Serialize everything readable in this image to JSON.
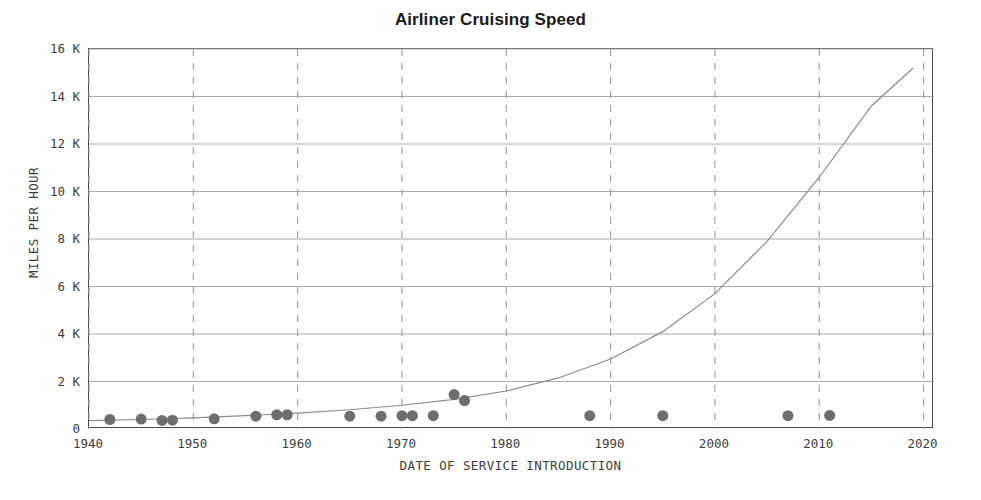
{
  "chart_data": {
    "type": "scatter",
    "title": "Airliner Cruising Speed",
    "xlabel": "DATE OF SERVICE INTRODUCTION",
    "ylabel": "MILES PER HOUR",
    "xlim": [
      1940,
      2021
    ],
    "ylim": [
      0,
      16000
    ],
    "xticks": [
      1940,
      1950,
      1960,
      1970,
      1980,
      1990,
      2000,
      2010,
      2020
    ],
    "xticklabels": [
      "1940",
      "1950",
      "1960",
      "1970",
      "1980",
      "1990",
      "2000",
      "2010",
      "2020"
    ],
    "yticks": [
      0,
      2000,
      4000,
      6000,
      8000,
      10000,
      12000,
      14000,
      16000
    ],
    "yticklabels": [
      "0",
      "2 K",
      "4 K",
      "6 K",
      "8 K",
      "10 K",
      "12 K",
      "14 K",
      "16 K"
    ],
    "grid": "horizontal solid gray, vertical dashed gray",
    "legend": "none",
    "marker_color": "#6e6e6e",
    "marker_size": 11,
    "curve_color": "#8c8c8c",
    "points": [
      {
        "x": 1942,
        "y": 400
      },
      {
        "x": 1945,
        "y": 420
      },
      {
        "x": 1947,
        "y": 360
      },
      {
        "x": 1948,
        "y": 370
      },
      {
        "x": 1952,
        "y": 430
      },
      {
        "x": 1956,
        "y": 540
      },
      {
        "x": 1958,
        "y": 600
      },
      {
        "x": 1959,
        "y": 600
      },
      {
        "x": 1965,
        "y": 540
      },
      {
        "x": 1968,
        "y": 540
      },
      {
        "x": 1970,
        "y": 560
      },
      {
        "x": 1971,
        "y": 560
      },
      {
        "x": 1973,
        "y": 560
      },
      {
        "x": 1975,
        "y": 1450
      },
      {
        "x": 1976,
        "y": 1200
      },
      {
        "x": 1988,
        "y": 560
      },
      {
        "x": 1995,
        "y": 560
      },
      {
        "x": 2007,
        "y": 560
      },
      {
        "x": 2011,
        "y": 570
      }
    ],
    "trend_curve": {
      "description": "exponential fit rising from ~350 mph in 1940 to ~15.2K mph in 2019",
      "x": [
        1940,
        1945,
        1950,
        1955,
        1960,
        1965,
        1970,
        1975,
        1980,
        1985,
        1990,
        1995,
        2000,
        2005,
        2010,
        2015,
        2019
      ],
      "y": [
        350,
        400,
        470,
        560,
        670,
        810,
        1000,
        1250,
        1600,
        2150,
        2950,
        4100,
        5700,
        7900,
        10600,
        13600,
        15200
      ]
    }
  }
}
